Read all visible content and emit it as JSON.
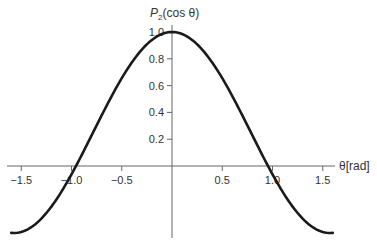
{
  "chart_data": {
    "type": "line",
    "title": "",
    "xlabel": "θ[rad]",
    "ylabel": "P₂(cos θ)",
    "ylabel_parts": {
      "P": "P",
      "sub": "2",
      "rest": "(cos θ)"
    },
    "xlim": [
      -1.6,
      1.6
    ],
    "ylim": [
      -0.5,
      1.0
    ],
    "grid": false,
    "legend": "none",
    "x_ticks": [
      -1.5,
      -1.0,
      -0.5,
      0.5,
      1.0,
      1.5
    ],
    "x_tick_labels": [
      "−1.5",
      "−1.0",
      "−0.5",
      "0.5",
      "1.0",
      "1.5"
    ],
    "y_ticks": [
      0.2,
      0.4,
      0.6,
      0.8,
      1.0
    ],
    "y_tick_labels": [
      "0.2",
      "0.4",
      "0.6",
      "0.8",
      "1.0"
    ],
    "series": [
      {
        "name": "P2(cos θ) = (3cos²θ − 1)/2",
        "x": [
          -1.6,
          -1.4,
          -1.2,
          -1.0,
          -0.9553,
          -0.8,
          -0.6,
          -0.4,
          -0.2,
          0.0,
          0.2,
          0.4,
          0.6,
          0.8,
          0.9553,
          1.0,
          1.2,
          1.4,
          1.6
        ],
        "values": [
          -0.499,
          -0.457,
          -0.296,
          -0.062,
          0.0,
          0.228,
          0.524,
          0.774,
          0.941,
          1.0,
          0.941,
          0.774,
          0.524,
          0.228,
          0.0,
          -0.062,
          -0.296,
          -0.457,
          -0.499
        ]
      }
    ],
    "colors": {
      "curve": "#1a1a1a",
      "axis": "#666666",
      "text": "#333333"
    }
  }
}
